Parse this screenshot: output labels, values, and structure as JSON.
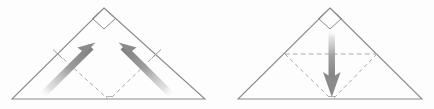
{
  "figure": {
    "background_color": "#fdfdfd",
    "outline_color": "#8c8c8c",
    "dashed_color": "#a8a8a8",
    "arrow_color": "#9a9a9a",
    "arrow_tip_color": "#7d7d7d"
  },
  "panels": [
    {
      "id": "panel-left",
      "label": "Step 1",
      "shape": {
        "name": "isosceles-right-triangle",
        "apex": {
          "x": 104,
          "y": 8
        },
        "bottom_left": {
          "x": 12,
          "y": 99
        },
        "bottom_right": {
          "x": 205,
          "y": 99
        }
      },
      "right_angle_marker": {
        "name": "right-angle-square",
        "position": "apex",
        "size": 15
      },
      "fold_lines": [
        {
          "name": "fold-line-left",
          "style": "dashed",
          "from": {
            "x": 58,
            "y": 54
          },
          "to": {
            "x": 108,
            "y": 99
          }
        },
        {
          "name": "fold-line-right",
          "style": "dashed",
          "from": {
            "x": 156,
            "y": 54
          },
          "to": {
            "x": 110,
            "y": 99
          }
        }
      ],
      "tick_marks": [
        {
          "name": "midpoint-tick-left",
          "x": 58,
          "y": 54
        },
        {
          "name": "midpoint-tick-right",
          "x": 156,
          "y": 54
        }
      ],
      "arrows": [
        {
          "name": "fold-arrow-up-right",
          "direction": "up-right",
          "from": {
            "x": 42,
            "y": 93
          },
          "to": {
            "x": 93,
            "y": 44
          }
        },
        {
          "name": "fold-arrow-up-left",
          "direction": "up-left",
          "from": {
            "x": 172,
            "y": 93
          },
          "to": {
            "x": 121,
            "y": 44
          }
        }
      ]
    },
    {
      "id": "panel-right",
      "label": "Step 2",
      "shape": {
        "name": "isosceles-right-triangle",
        "apex": {
          "x": 330,
          "y": 8
        },
        "bottom_left": {
          "x": 238,
          "y": 99
        },
        "bottom_right": {
          "x": 422,
          "y": 99
        }
      },
      "right_angle_marker": {
        "name": "right-angle-square",
        "position": "apex",
        "size": 15
      },
      "fold_lines": [
        {
          "name": "fold-line-horizontal",
          "style": "dashed",
          "from": {
            "x": 285,
            "y": 54
          },
          "to": {
            "x": 377,
            "y": 54
          }
        },
        {
          "name": "fold-line-left",
          "style": "dashed",
          "from": {
            "x": 285,
            "y": 54
          },
          "to": {
            "x": 331,
            "y": 99
          }
        },
        {
          "name": "fold-line-right",
          "style": "dashed",
          "from": {
            "x": 377,
            "y": 54
          },
          "to": {
            "x": 333,
            "y": 99
          }
        }
      ],
      "tick_marks": [],
      "arrows": [
        {
          "name": "fold-arrow-down",
          "direction": "down",
          "from": {
            "x": 332,
            "y": 30
          },
          "to": {
            "x": 332,
            "y": 96
          }
        }
      ]
    }
  ]
}
